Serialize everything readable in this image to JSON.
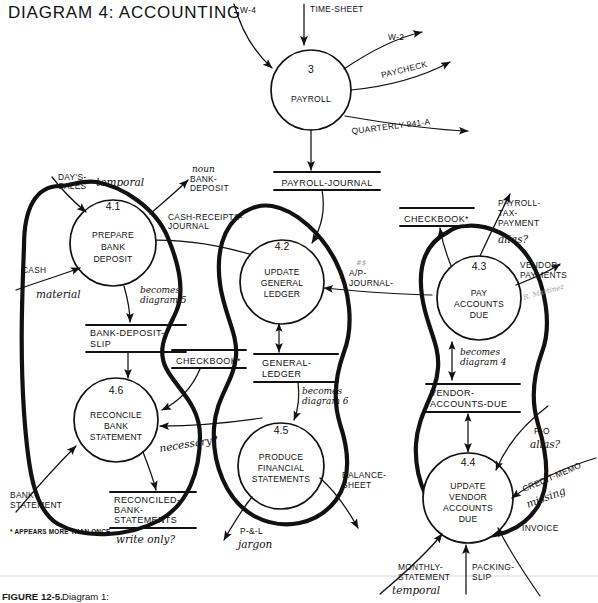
{
  "figure": {
    "title": "DIAGRAM 4: ACCOUNTING",
    "caption_bold": "FIGURE 12-5.",
    "caption_rest": "Diagram 1:",
    "footnote": "* APPEARS MORE THAN ONCE",
    "faint_margin_note": "R. Martinez"
  },
  "processes": [
    {
      "id": "p3",
      "number": "3",
      "line1": "PAYROLL",
      "line2": "",
      "line3": "",
      "line4": ""
    },
    {
      "id": "p41",
      "number": "4.1",
      "line1": "PREPARE",
      "line2": "BANK",
      "line3": "DEPOSIT",
      "line4": ""
    },
    {
      "id": "p42",
      "number": "4.2",
      "line1": "UPDATE",
      "line2": "GENERAL",
      "line3": "LEDGER",
      "line4": ""
    },
    {
      "id": "p43",
      "number": "4.3",
      "line1": "PAY",
      "line2": "ACCOUNTS",
      "line3": "DUE",
      "line4": ""
    },
    {
      "id": "p44",
      "number": "4.4",
      "line1": "UPDATE",
      "line2": "VENDOR",
      "line3": "ACCOUNTS",
      "line4": "DUE"
    },
    {
      "id": "p45",
      "number": "4.5",
      "line1": "PRODUCE",
      "line2": "FINANCIAL",
      "line3": "STATEMENTS",
      "line4": ""
    },
    {
      "id": "p46",
      "number": "4.6",
      "line1": "RECONCILE",
      "line2": "BANK",
      "line3": "STATEMENT",
      "line4": ""
    }
  ],
  "stores": [
    {
      "id": "s_payroll_journal",
      "line1": "PAYROLL-JOURNAL",
      "line2": ""
    },
    {
      "id": "s_bank_dep_slip",
      "line1": "BANK-DEPOSIT-",
      "line2": "SLIP"
    },
    {
      "id": "s_checkbook_left",
      "line1": "CHECKBOOK*",
      "line2": ""
    },
    {
      "id": "s_checkbook_right",
      "line1": "CHECKBOOK*",
      "line2": ""
    },
    {
      "id": "s_general_ledger",
      "line1": "GENERAL-",
      "line2": "LEDGER"
    },
    {
      "id": "s_vendor_acc_due",
      "line1": "VENDOR-",
      "line2": "ACCOUNTS-DUE"
    },
    {
      "id": "s_recon_bank",
      "line1": "RECONCILED-",
      "line2": "BANK-",
      "line3": "STATEMENTS"
    }
  ],
  "flows": [
    {
      "id": "f_w4",
      "line1": "W-4",
      "line2": ""
    },
    {
      "id": "f_time_sheet",
      "line1": "TIME-SHEET",
      "line2": ""
    },
    {
      "id": "f_w2",
      "line1": "W-2",
      "line2": ""
    },
    {
      "id": "f_paycheck",
      "line1": "PAYCHECK",
      "line2": ""
    },
    {
      "id": "f_quarterly",
      "line1": "QUARTERLY-941-A",
      "line2": ""
    },
    {
      "id": "f_days_sales",
      "line1": "DAY'S-",
      "line2": "SALES"
    },
    {
      "id": "f_bank_deposit",
      "line1": "BANK-",
      "line2": "DEPOSIT"
    },
    {
      "id": "f_cash_receipts",
      "line1": "CASH-RECEIPTS-",
      "line2": "JOURNAL"
    },
    {
      "id": "f_cash",
      "line1": "CASH",
      "line2": ""
    },
    {
      "id": "f_ap_journal",
      "line1": "A/P-",
      "line2": "JOURNAL-"
    },
    {
      "id": "f_payroll_tax",
      "line1": "PAYROLL-",
      "line2": "TAX-",
      "line3": "PAYMENT"
    },
    {
      "id": "f_vendor_pay",
      "line1": "VENDOR-",
      "line2": "PAYMENTS"
    },
    {
      "id": "f_bank_statement",
      "line1": "BANK-",
      "line2": "STATEMENT"
    },
    {
      "id": "f_balance_sheet",
      "line1": "BALANCE-",
      "line2": "SHEET"
    },
    {
      "id": "f_pl",
      "line1": "P-&-L",
      "line2": ""
    },
    {
      "id": "f_po",
      "line1": "P-O",
      "line2": ""
    },
    {
      "id": "f_credit_memo",
      "line1": "CREDIT-MEMO",
      "line2": ""
    },
    {
      "id": "f_invoice",
      "line1": "INVOICE",
      "line2": ""
    },
    {
      "id": "f_monthly_stmt",
      "line1": "MONTHLY-",
      "line2": "STATEMENT"
    },
    {
      "id": "f_packing_slip",
      "line1": "PACKING-",
      "line2": "SLIP"
    }
  ],
  "annotations": [
    {
      "id": "a_temporal_1",
      "text": "temporal"
    },
    {
      "id": "a_noun",
      "text": "noun"
    },
    {
      "id": "a_material",
      "text": "material"
    },
    {
      "id": "a_becomes_d5",
      "line1": "becomes",
      "line2": "diagram 5"
    },
    {
      "id": "a_becomes_d4",
      "line1": "becomes",
      "line2": "diagram 4"
    },
    {
      "id": "a_becomes_d6",
      "line1": "becomes",
      "line2": "diagram 6"
    },
    {
      "id": "a_alias_1",
      "text": "alias?"
    },
    {
      "id": "a_alias_2",
      "text": "alias?"
    },
    {
      "id": "a_necessary",
      "text": "necessary?"
    },
    {
      "id": "a_write_only",
      "text": "write only?"
    },
    {
      "id": "a_jargon",
      "text": "jargon"
    },
    {
      "id": "a_missing",
      "text": "missing"
    },
    {
      "id": "a_temporal_2",
      "text": "temporal"
    }
  ],
  "colors": {
    "ink": "#111111",
    "paper": "#ffffff",
    "faint": "#9a9a9a"
  }
}
